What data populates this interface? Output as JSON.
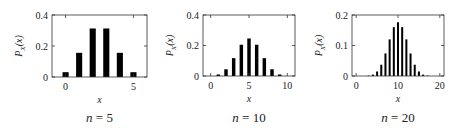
{
  "figure": {
    "panels": [
      {
        "caption": "n = 5",
        "n_label": "n",
        "n_value": "5"
      },
      {
        "caption": "n = 10",
        "n_label": "n",
        "n_value": "10"
      },
      {
        "caption": "n = 20",
        "n_label": "n",
        "n_value": "20"
      }
    ]
  },
  "colors": {
    "bar": "#000000",
    "axis": "#333333",
    "background": "#ffffff"
  },
  "chart_data": [
    {
      "type": "bar",
      "title": "n = 5",
      "xlabel": "x",
      "ylabel": "P_X(x)",
      "x": [
        0,
        1,
        2,
        3,
        4,
        5
      ],
      "values": [
        0.031,
        0.156,
        0.313,
        0.313,
        0.156,
        0.031
      ],
      "xlim": [
        -1,
        6
      ],
      "ylim": [
        0,
        0.4
      ],
      "xticks": [
        0,
        5
      ],
      "yticks": [
        0,
        0.2,
        0.4
      ],
      "ytick_labels": [
        "0",
        "0.2",
        "0.4"
      ],
      "grid": false,
      "box": [
        52,
        15,
        147,
        77
      ]
    },
    {
      "type": "bar",
      "title": "n = 10",
      "xlabel": "x",
      "ylabel": "P_X(x)",
      "x": [
        0,
        1,
        2,
        3,
        4,
        5,
        6,
        7,
        8,
        9,
        10
      ],
      "values": [
        0.001,
        0.01,
        0.044,
        0.117,
        0.205,
        0.246,
        0.205,
        0.117,
        0.044,
        0.01,
        0.001
      ],
      "xlim": [
        -1,
        11
      ],
      "ylim": [
        0,
        0.4
      ],
      "xticks": [
        0,
        5,
        10
      ],
      "yticks": [
        0,
        0.2,
        0.4
      ],
      "ytick_labels": [
        "0",
        "0.2",
        "0.4"
      ],
      "grid": false,
      "box": [
        203,
        15,
        295,
        76
      ]
    },
    {
      "type": "bar",
      "title": "n = 20",
      "xlabel": "x",
      "ylabel": "P_X(x)",
      "x": [
        0,
        1,
        2,
        3,
        4,
        5,
        6,
        7,
        8,
        9,
        10,
        11,
        12,
        13,
        14,
        15,
        16,
        17,
        18,
        19,
        20
      ],
      "values": [
        1e-06,
        2e-05,
        0.0002,
        0.0011,
        0.0046,
        0.0148,
        0.037,
        0.0739,
        0.1201,
        0.1602,
        0.1762,
        0.1602,
        0.1201,
        0.0739,
        0.037,
        0.0148,
        0.0046,
        0.0011,
        0.0002,
        2e-05,
        1e-06
      ],
      "xlim": [
        -1,
        21
      ],
      "ylim": [
        0,
        0.2
      ],
      "xticks": [
        0,
        10,
        20
      ],
      "yticks": [
        0,
        0.1,
        0.2
      ],
      "ytick_labels": [
        "0",
        "0.1",
        "0.2"
      ],
      "grid": false,
      "box": [
        352,
        15,
        444,
        76
      ]
    }
  ]
}
